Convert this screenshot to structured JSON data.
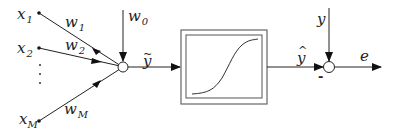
{
  "diagram": {
    "inputs": [
      {
        "base": "x",
        "sub": "1"
      },
      {
        "base": "x",
        "sub": "2"
      },
      {
        "base": "x",
        "sub": "M"
      }
    ],
    "ellipsis": "⋮",
    "weights": [
      {
        "base": "w",
        "sub": "1"
      },
      {
        "base": "w",
        "sub": "2"
      },
      {
        "base": "w",
        "sub": "M"
      }
    ],
    "bias": {
      "base": "w",
      "sub": "0"
    },
    "sum_output": {
      "base": "y",
      "accent": "~"
    },
    "activation_block": "sigmoid",
    "activation_output": {
      "base": "y",
      "accent": "^"
    },
    "target": "y",
    "minus_sign": "-",
    "error": "e",
    "colors": {
      "line": "#222222",
      "box_outer": "#555555",
      "box_inner": "#555555",
      "curve": "#333333"
    }
  }
}
